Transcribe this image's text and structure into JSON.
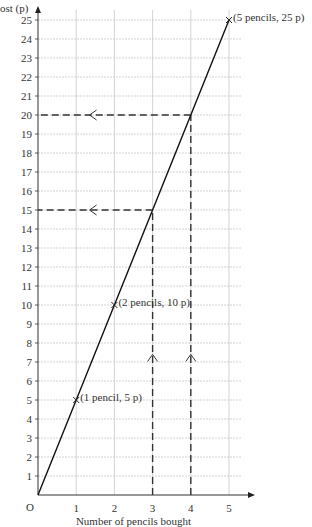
{
  "chart_data": {
    "type": "line",
    "title": "",
    "xlabel": "Number of pencils bought",
    "ylabel": "ost (p)",
    "origin_label": "O",
    "xlim": [
      0,
      5
    ],
    "ylim": [
      0,
      25
    ],
    "x_ticks": [
      1,
      2,
      3,
      4,
      5
    ],
    "y_ticks": [
      1,
      2,
      3,
      4,
      5,
      6,
      7,
      8,
      9,
      10,
      11,
      12,
      13,
      14,
      15,
      16,
      17,
      18,
      19,
      20,
      21,
      22,
      23,
      24,
      25
    ],
    "grid": true,
    "series": [
      {
        "name": "Cost of pencils",
        "x": [
          0,
          1,
          2,
          3,
          4,
          5
        ],
        "y": [
          0,
          5,
          10,
          15,
          20,
          25
        ]
      }
    ],
    "marked_points": [
      {
        "x": 1,
        "y": 5,
        "label": "(1 pencil, 5 p)"
      },
      {
        "x": 2,
        "y": 10,
        "label": "(2 pencils, 10 p)"
      },
      {
        "x": 5,
        "y": 25,
        "label": "(5 pencils, 25 p)"
      }
    ],
    "reading_lines": [
      {
        "from_x": 3,
        "to_y": 15
      },
      {
        "from_x": 4,
        "to_y": 20
      }
    ]
  }
}
